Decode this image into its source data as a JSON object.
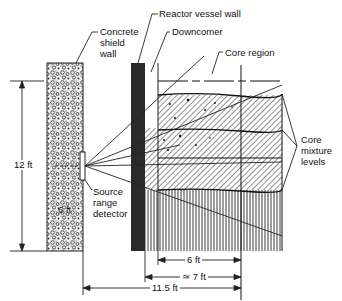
{
  "diagram": {
    "labels": {
      "concrete_shield_wall": [
        "Concrete",
        "shield",
        "wall"
      ],
      "reactor_vessel_wall": "Reactor vessel wall",
      "downcomer": "Downcomer",
      "core_region": "Core region",
      "core_mixture_levels": [
        "Core",
        "mixture",
        "levels"
      ],
      "source_range_detector": [
        "Source",
        "range",
        "detector"
      ]
    },
    "dimensions": {
      "height": "12 ft",
      "detector_height": "6 ft",
      "core_radius": "6 ft",
      "vessel_to_center": "≃ 7 ft",
      "detector_to_center": "11.5 ft"
    },
    "colors": {
      "line": "#111111",
      "vessel_wall": "#2a2a2a",
      "background": "#ffffff"
    }
  }
}
